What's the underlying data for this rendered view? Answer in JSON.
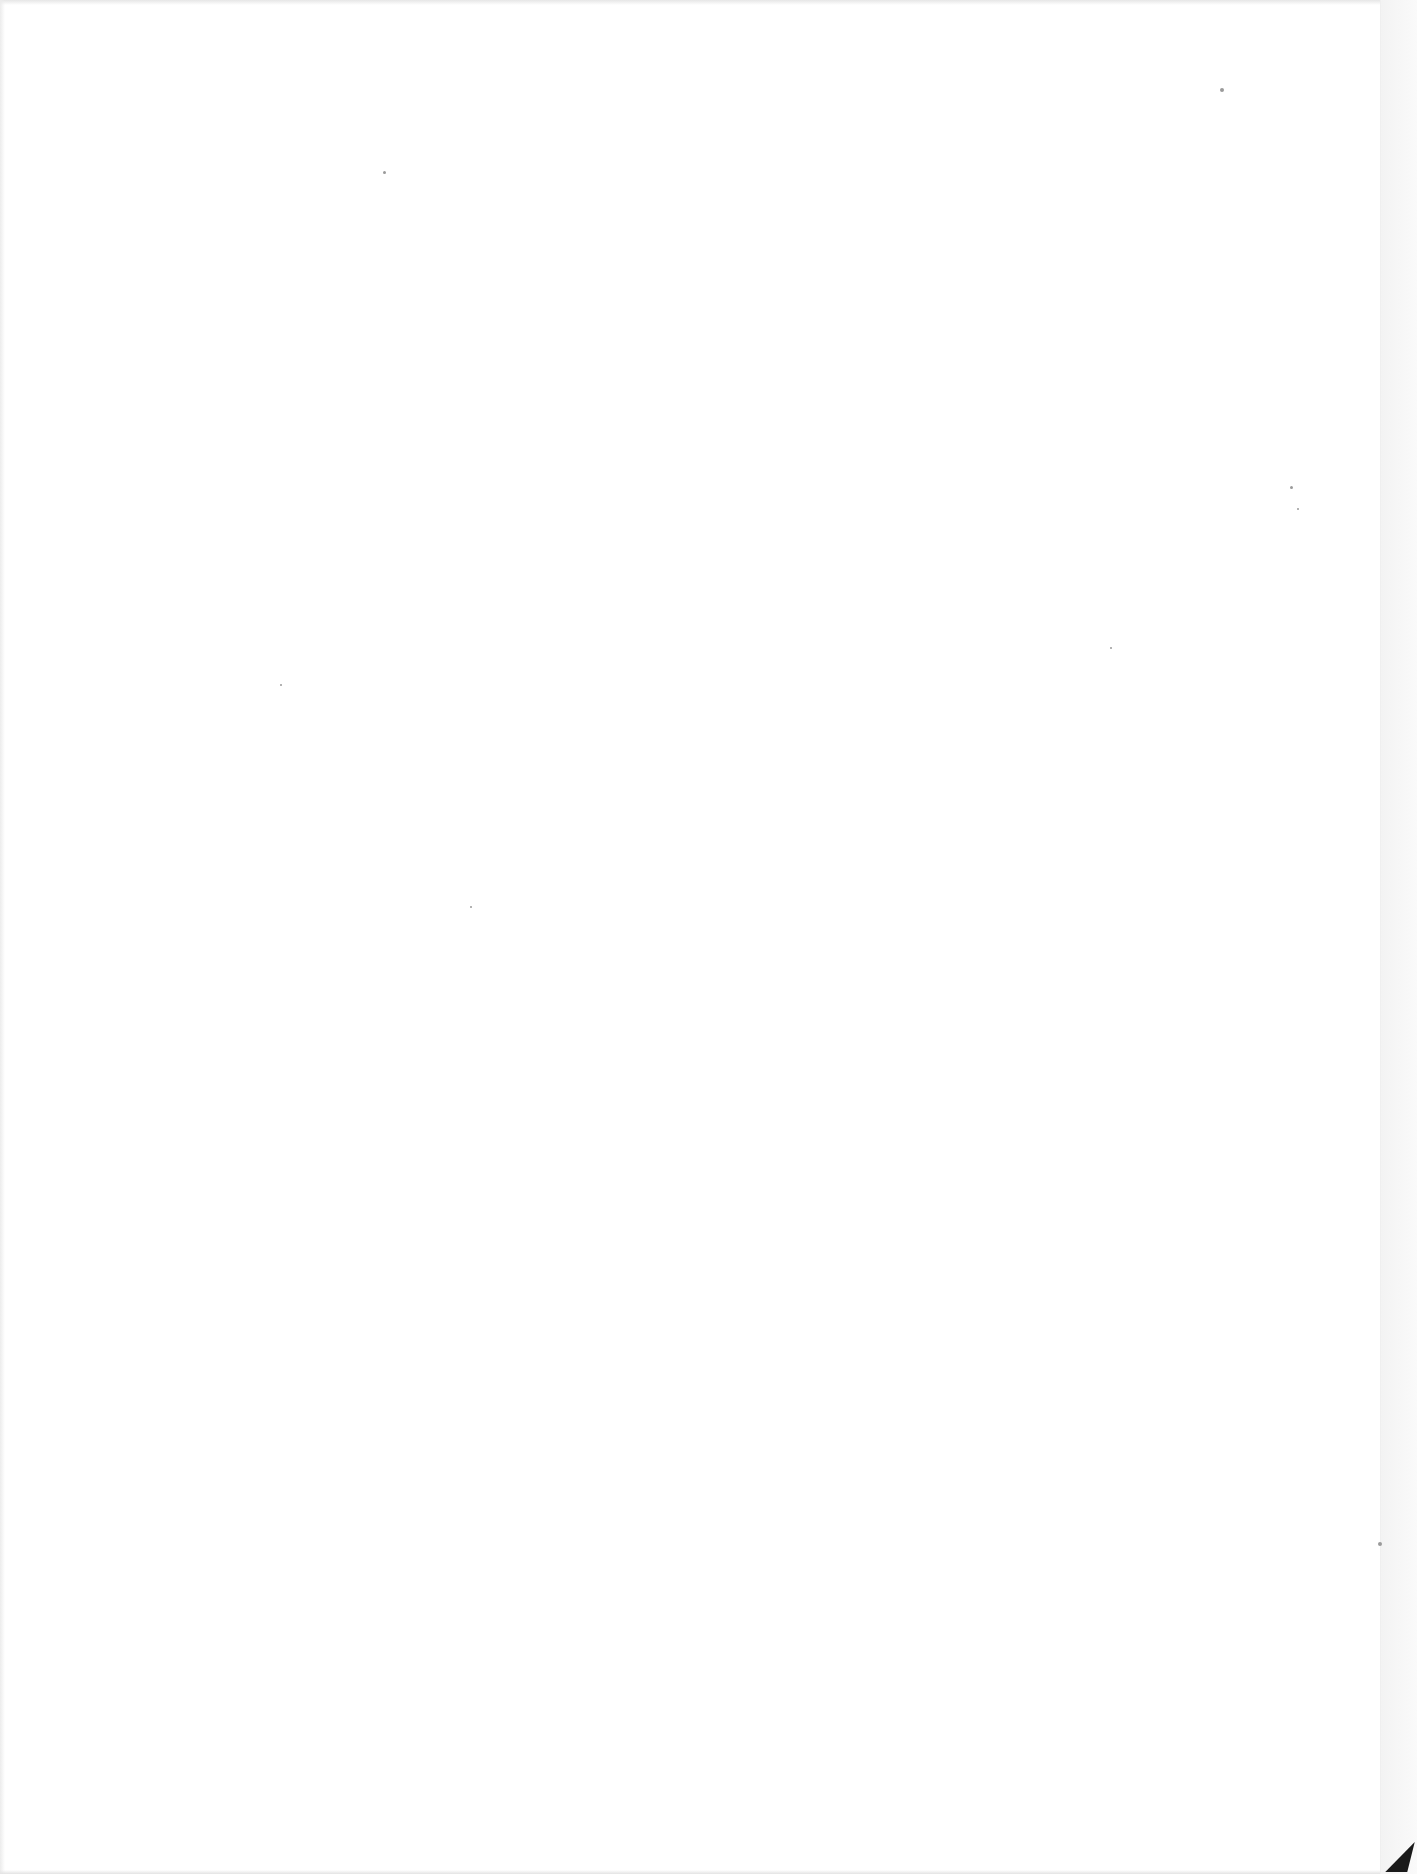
{
  "document": {
    "type": "blank-scanned-page",
    "text": "",
    "background_color": "#ffffff",
    "corner_fold_color": "#1a1a1a"
  },
  "specks": [
    {
      "x": 383,
      "y": 171,
      "size": 3
    },
    {
      "x": 1220,
      "y": 88,
      "size": 4
    },
    {
      "x": 470,
      "y": 906,
      "size": 2
    },
    {
      "x": 1110,
      "y": 647,
      "size": 2
    },
    {
      "x": 1290,
      "y": 486,
      "size": 3
    },
    {
      "x": 1297,
      "y": 508,
      "size": 2
    },
    {
      "x": 1378,
      "y": 1542,
      "size": 4
    },
    {
      "x": 280,
      "y": 684,
      "size": 2
    }
  ]
}
